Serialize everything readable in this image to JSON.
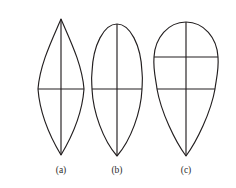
{
  "figure": {
    "background_color": "#ffffff",
    "stroke_color": "#231f20",
    "label_color": "#2b2b2b",
    "width": 236,
    "height": 188,
    "panel_count": 3
  },
  "panels": [
    {
      "id": "a",
      "label": "(a)",
      "shape_name": "lanceolate-lens-outline",
      "description": "Pointed at both apex and base, widest at middle",
      "center_x": 61,
      "apex_y": 19,
      "base_y": 155,
      "max_half_width": 23,
      "widest_y": 89,
      "vertical_axis": {
        "x": 61,
        "y1": 19,
        "y2": 155
      },
      "horizontal_axes": [
        {
          "y": 89,
          "x1": 38,
          "x2": 84
        }
      ],
      "label_x": 61,
      "label_y": 165
    },
    {
      "id": "b",
      "label": "(b)",
      "shape_name": "ovate-outline",
      "description": "Rounded apex, pointed base, widest at middle",
      "center_x": 117,
      "apex_y": 24,
      "base_y": 156,
      "max_half_width": 25,
      "widest_y": 89,
      "vertical_axis": {
        "x": 117,
        "y1": 24,
        "y2": 156
      },
      "horizontal_axes": [
        {
          "y": 89,
          "x1": 92,
          "x2": 142
        }
      ],
      "label_x": 117,
      "label_y": 165
    },
    {
      "id": "c",
      "label": "(c)",
      "shape_name": "obovate-teardrop-outline",
      "description": "Broad rounded apex, tapering pointed base, two transverse axes",
      "center_x": 186,
      "apex_y": 22,
      "base_y": 156,
      "max_half_width": 32,
      "widest_y": 57,
      "vertical_axis": {
        "x": 186,
        "y1": 22,
        "y2": 156
      },
      "horizontal_axes": [
        {
          "y": 57,
          "x1": 154,
          "x2": 218
        },
        {
          "y": 89,
          "x1": 157,
          "x2": 215
        }
      ],
      "label_x": 186,
      "label_y": 165
    }
  ]
}
